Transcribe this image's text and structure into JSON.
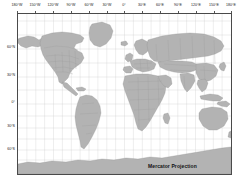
{
  "figure": {
    "caption": "Mercator Projection",
    "frame": {
      "left": 17,
      "top": 13,
      "width": 215,
      "height": 162
    },
    "colors": {
      "land": "#b3b3b3",
      "land_border": "#8c8c8c",
      "ocean": "#ffffff",
      "graticule": "#c8c8c8",
      "frame": "#4a4a4a",
      "text": "#1a1a1a",
      "background": "#ffffff"
    }
  },
  "axes": {
    "longitude_labels": [
      {
        "text": "180°W",
        "value": -180,
        "x": 17
      },
      {
        "text": "150°W",
        "value": -150,
        "x": 35
      },
      {
        "text": "120°W",
        "value": -120,
        "x": 53
      },
      {
        "text": "90°W",
        "value": -90,
        "x": 71
      },
      {
        "text": "60°W",
        "value": -60,
        "x": 89
      },
      {
        "text": "30°W",
        "value": -30,
        "x": 107
      },
      {
        "text": "0°",
        "value": 0,
        "x": 124
      },
      {
        "text": "30°E",
        "value": 30,
        "x": 142
      },
      {
        "text": "60°E",
        "value": 60,
        "x": 160
      },
      {
        "text": "90°E",
        "value": 90,
        "x": 178
      },
      {
        "text": "120°E",
        "value": 120,
        "x": 196
      },
      {
        "text": "150°E",
        "value": 150,
        "x": 214
      },
      {
        "text": "180°E",
        "value": 180,
        "x": 231
      }
    ],
    "latitude_labels": [
      {
        "text": "60°N",
        "value": 60,
        "y": 48
      },
      {
        "text": "30°N",
        "value": 30,
        "y": 76
      },
      {
        "text": "0°",
        "value": 0,
        "y": 103
      },
      {
        "text": "30°S",
        "value": -30,
        "y": 127
      },
      {
        "text": "60°S",
        "value": -60,
        "y": 150
      }
    ],
    "grid": true,
    "grid_spacing_degrees": 15,
    "xlim": [
      -180,
      180
    ],
    "ylim": [
      -75,
      84
    ]
  },
  "chart_data": {
    "type": "map",
    "projection": "Mercator",
    "title": "Mercator Projection",
    "xlabel": "Longitude",
    "ylabel": "Latitude",
    "grid": true,
    "legend": null,
    "features": [
      "world-coastlines",
      "country-borders",
      "us-state-borders",
      "graticule-15-degree"
    ]
  }
}
